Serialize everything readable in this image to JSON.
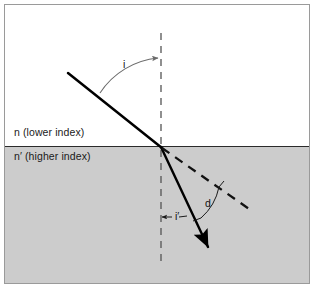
{
  "figure": {
    "type": "optics-refraction-diagram",
    "media": {
      "upper_label": "n (lower index)",
      "lower_label": "n′ (higher index)"
    },
    "angles": {
      "incidence_label": "i",
      "refraction_label": "i′",
      "deviation_label": "d"
    },
    "colors": {
      "upper_medium": "#ffffff",
      "lower_medium": "#cccccc",
      "ray": "#000000",
      "normal": "#555555",
      "arc": "#6b6b6b",
      "border": "#9a9a9a",
      "interface": "#2b2b2b"
    },
    "geometry": {
      "interface_y": 142,
      "normal_x": 156,
      "incidence_point_x": 156,
      "incidence_point_y": 142,
      "incident_ray_start_x": 63,
      "incident_ray_start_y": 68,
      "refracted_ray_end_x": 205,
      "refracted_ray_end_y": 245,
      "undeviated_ray_end_x": 247,
      "undeviated_ray_end_y": 206
    }
  }
}
